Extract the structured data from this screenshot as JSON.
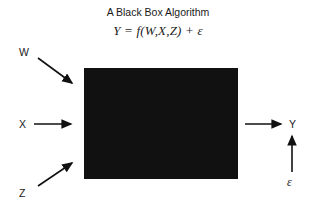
{
  "figure": {
    "title": "A Black Box Algorithm",
    "formula": "Y = f(W,X,Z) + ε",
    "background_color": "#ffffff",
    "box_color": "#111111",
    "ink_color": "#1a1a1a"
  },
  "inputs": [
    {
      "label": "W",
      "arrow": "diagonal-down-right"
    },
    {
      "label": "X",
      "arrow": "right"
    },
    {
      "label": "Z",
      "arrow": "diagonal-up-right"
    }
  ],
  "output": {
    "label": "Y",
    "arrow": "right"
  },
  "noise": {
    "label": "ε",
    "arrow": "up"
  },
  "black_box": {
    "label": "black-box",
    "x": 84,
    "y": 68,
    "width": 154,
    "height": 111
  }
}
